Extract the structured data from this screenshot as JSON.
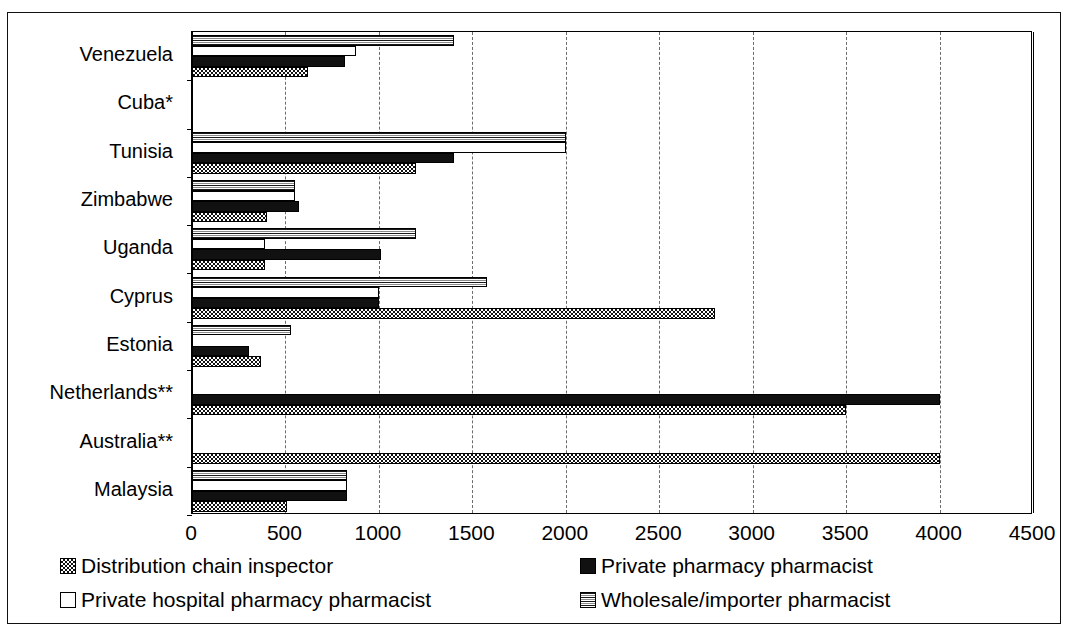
{
  "chart_data": {
    "type": "bar",
    "orientation": "horizontal",
    "title": "",
    "xlabel": "",
    "ylabel": "",
    "xlim": [
      0,
      4500
    ],
    "xticks": [
      0,
      500,
      1000,
      1500,
      2000,
      2500,
      3000,
      3500,
      4000,
      4500
    ],
    "xtick_labels": [
      "0",
      "500",
      "1000",
      "1500",
      "2000",
      "2500",
      "3000",
      "3500",
      "4000",
      "4500"
    ],
    "grid": "vertical-dashed",
    "legend_position": "bottom",
    "categories": [
      "Venezuela",
      "Cuba*",
      "Tunisia",
      "Zimbabwe",
      "Uganda",
      "Cyprus",
      "Estonia",
      "Netherlands**",
      "Australia**",
      "Malaysia"
    ],
    "series": [
      {
        "name": "Wholesale/importer pharmacist",
        "key": "wholesale",
        "values": [
          1400,
          0,
          2000,
          550,
          1200,
          1580,
          530,
          0,
          0,
          830
        ]
      },
      {
        "name": "Private hospital pharmacy pharmacist",
        "key": "hospital",
        "values": [
          880,
          0,
          2000,
          550,
          390,
          1000,
          0,
          0,
          0,
          830
        ]
      },
      {
        "name": "Private pharmacy pharmacist",
        "key": "pharmacy",
        "values": [
          820,
          0,
          1400,
          570,
          1010,
          1000,
          305,
          4000,
          0,
          830
        ]
      },
      {
        "name": "Distribution chain inspector",
        "key": "inspector",
        "values": [
          620,
          0,
          1200,
          400,
          390,
          2800,
          370,
          3500,
          4000,
          510
        ]
      }
    ]
  },
  "legend": {
    "items": [
      {
        "label": "Distribution chain inspector",
        "swatch": "inspector",
        "column": 0,
        "row": 0
      },
      {
        "label": "Private pharmacy pharmacist",
        "swatch": "pharmacy",
        "column": 1,
        "row": 0
      },
      {
        "label": "Private hospital pharmacy pharmacist",
        "swatch": "hospital",
        "column": 0,
        "row": 1
      },
      {
        "label": "Wholesale/importer pharmacist",
        "swatch": "wholesale",
        "column": 1,
        "row": 1
      }
    ]
  },
  "colors": {
    "ink": "#111111",
    "paper": "#ffffff",
    "gridline": "#6b6b6b"
  }
}
